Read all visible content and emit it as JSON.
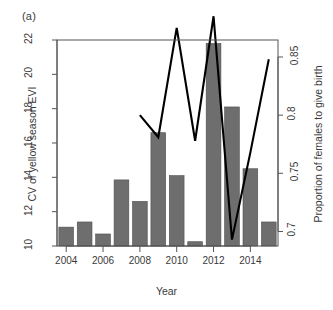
{
  "panel": {
    "label": "(a)"
  },
  "chart_data": {
    "type": "bar",
    "title": "",
    "subtitle": "",
    "xlabel": "Year",
    "ylabel": "CV of yellow season EVI",
    "y2label": "Proportion of females to give birth",
    "grid": false,
    "legend": "none",
    "xlim": [
      2003.5,
      2015.5
    ],
    "ylim": [
      10,
      22
    ],
    "y2lim": [
      0.6875,
      0.8646
    ],
    "categories": [
      2004,
      2005,
      2006,
      2007,
      2008,
      2009,
      2010,
      2011,
      2012,
      2013,
      2014,
      2015
    ],
    "xticks": [
      2004,
      2006,
      2008,
      2010,
      2012,
      2014
    ],
    "xticklabels": [
      "2004",
      "2006",
      "2008",
      "2010",
      "2012",
      "2014"
    ],
    "yticks": [
      10,
      12,
      14,
      16,
      18,
      20,
      22
    ],
    "yticklabels": [
      "10",
      "12",
      "14",
      "16",
      "18",
      "20",
      "22"
    ],
    "y2ticks": [
      0.7,
      0.75,
      0.8,
      0.85
    ],
    "y2ticklabels": [
      "0.7",
      "0.75",
      "0.8",
      "0.85"
    ],
    "bar_color": "#6e6e6e",
    "line_color": "#000000",
    "axis_color": "#555555",
    "series": [
      {
        "name": "CV of yellow season EVI",
        "type": "bar",
        "axis": "left",
        "values": [
          11.1,
          11.4,
          10.7,
          13.85,
          12.6,
          16.6,
          14.1,
          10.25,
          21.8,
          18.1,
          14.5,
          11.4
        ]
      },
      {
        "name": "Proportion of females to give birth",
        "type": "line",
        "axis": "right",
        "x": [
          2008,
          2009,
          2010,
          2011,
          2012,
          2013,
          2014,
          2015
        ],
        "values": [
          0.8,
          0.781,
          0.875,
          0.778,
          0.885,
          0.693,
          0.768,
          0.848
        ]
      }
    ]
  }
}
